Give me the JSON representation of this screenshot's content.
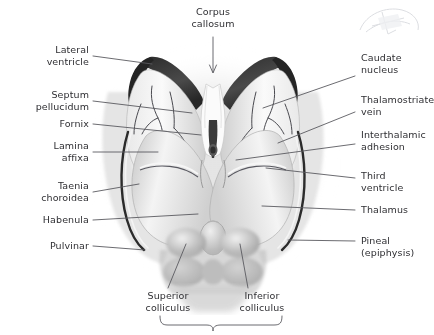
{
  "figure": {
    "title_visible": false,
    "background_color": "#ffffff",
    "text_color": "#2f2f33",
    "leader_color": "#5a5a60",
    "tissue_light": "#f2f2f2",
    "tissue_mid": "#d6d6d6",
    "tissue_dark": "#3a3a3a",
    "vein_color": "#4a4a50"
  },
  "labels": {
    "top_center": {
      "name": "corpus-callosum",
      "text": "Corpus\ncallosum"
    },
    "left": [
      {
        "name": "lateral-ventricle",
        "text": "Lateral\nventricle"
      },
      {
        "name": "septum-pellucidum",
        "text": "Septum\npellucidum"
      },
      {
        "name": "fornix",
        "text": "Fornix"
      },
      {
        "name": "lamina-affixa",
        "text": "Lamina\naffixa"
      },
      {
        "name": "taenia-choroidea",
        "text": "Taenia\nchoroidea"
      },
      {
        "name": "habenula",
        "text": "Habenula"
      },
      {
        "name": "pulvinar",
        "text": "Pulvinar"
      }
    ],
    "right": [
      {
        "name": "caudate-nucleus",
        "text": "Caudate\nnucleus"
      },
      {
        "name": "thalamostriate-vein",
        "text": "Thalamostriate\nvein"
      },
      {
        "name": "interthalamic-adhesion",
        "text": "Interthalamic\nadhesion"
      },
      {
        "name": "third-ventricle",
        "text": "Third\nventricle"
      },
      {
        "name": "thalamus",
        "text": "Thalamus"
      },
      {
        "name": "pineal-epiphysis",
        "text": "Pineal\n(epiphysis)"
      }
    ],
    "bottom": [
      {
        "name": "superior-colliculus",
        "text": "Superior\ncolliculus"
      },
      {
        "name": "inferior-colliculus",
        "text": "Inferior\ncolliculus"
      }
    ],
    "bottom_brace": {
      "name": "tectal-plate-brace",
      "text": ""
    }
  },
  "inset": {
    "name": "orientation-inset",
    "description": "faint grayscale head orientation thumbnail"
  }
}
